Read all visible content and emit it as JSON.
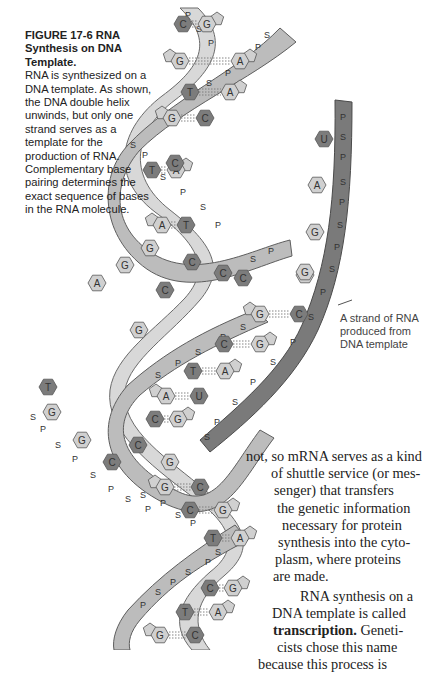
{
  "caption": {
    "figure_label": "FIGURE 17-6  RNA",
    "title": "Synthesis on DNA Template.",
    "text": "RNA is synthesized on a DNA template. As shown, the DNA double helix unwinds, but only one strand serves as a template for the production of RNA. Complementary base pairing determines the exact sequence of bases in the RNA molecule."
  },
  "annotation": {
    "rna_strand_label": "A strand of RNA produced from DNA template"
  },
  "body_text": {
    "lines": [
      "not, so mRNA serves as a kind",
      "of shuttle service (or mes-",
      "senger)   that   transfers",
      "the genetic information",
      "necessary  for  protein",
      "synthesis into the cyto-",
      "plasm,  where  proteins",
      "are made.",
      "RNA synthesis on a",
      "DNA template is called",
      "Geneti-",
      "cists  chose  this  name",
      "because  this  process  is"
    ],
    "bold_term": "transcription."
  },
  "illustration": {
    "backbone_labels": {
      "phosphate": "P",
      "sugar": "S"
    },
    "bases": [
      "A",
      "T",
      "G",
      "C",
      "U"
    ],
    "colors": {
      "purine_light": "#d0d0d0",
      "pyrimidine_dark": "#7c7c7c",
      "ribbon_light": "#d8d8d8",
      "ribbon_mid": "#bcbcbc",
      "rna_strand": "#7a7a7a"
    },
    "rna_bases": [
      "U",
      "A",
      "G",
      "G"
    ]
  }
}
